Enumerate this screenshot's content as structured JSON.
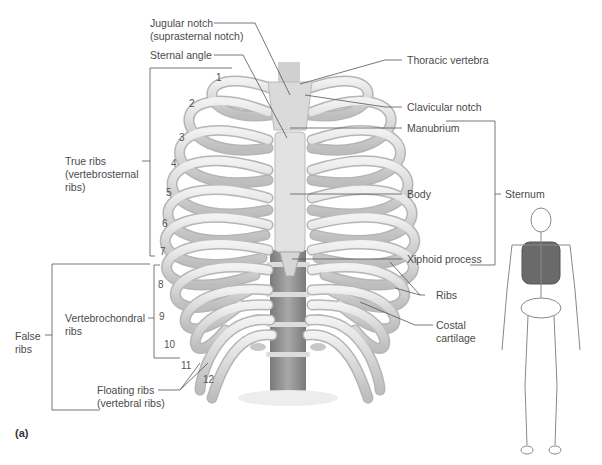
{
  "figure": {
    "panel_label": "(a)",
    "labels": {
      "jugular_notch": "Jugular notch",
      "jugular_notch_alt": "(suprasternal notch)",
      "sternal_angle": "Sternal angle",
      "thoracic_vertebra": "Thoracic vertebra",
      "clavicular_notch": "Clavicular notch",
      "manubrium": "Manubrium",
      "body": "Body",
      "sternum": "Sternum",
      "xiphoid_process": "Xiphoid process",
      "ribs": "Ribs",
      "costal_cartilage_1": "Costal",
      "costal_cartilage_2": "cartilage",
      "true_ribs_1": "True ribs",
      "true_ribs_2": "(vertebrosternal",
      "true_ribs_3": "ribs)",
      "vertebrochondral_1": "Vertebrochondral",
      "vertebrochondral_2": "ribs",
      "false_ribs_1": "False",
      "false_ribs_2": "ribs",
      "floating_ribs_1": "Floating ribs",
      "floating_ribs_2": "(vertebral ribs)"
    },
    "rib_numbers": [
      "1",
      "2",
      "3",
      "4",
      "5",
      "6",
      "7",
      "8",
      "9",
      "10",
      "11",
      "12"
    ],
    "colors": {
      "bone": "#e4e4e4",
      "bone_shadow": "#b9b9b9",
      "vertebra": "#8f8f8f",
      "leader_line": "#555555",
      "skeleton_highlight": "#6a6a6a"
    }
  }
}
